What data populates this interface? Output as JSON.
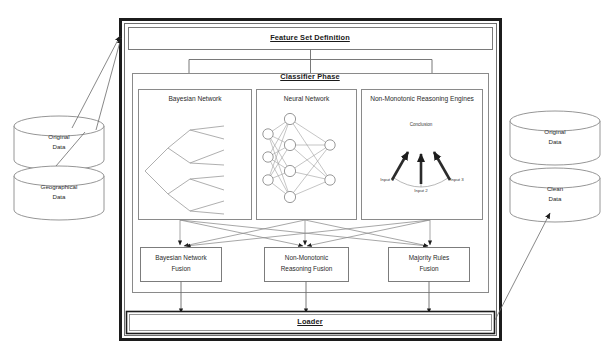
{
  "diagram": {
    "title_top": "Feature Set Definition",
    "title_bottom": "Loader",
    "classifier_phase_label": "Classifier Phase",
    "classifiers": [
      {
        "label": "Bayesian Network"
      },
      {
        "label": "Neural Network"
      },
      {
        "label": "Non-Monotonic Reasoning Engines"
      }
    ],
    "nmr_detail": {
      "conclusion": "Conclusion",
      "input1": "Input 1",
      "input2": "Input 2",
      "input3": "Input 3"
    },
    "fusion": [
      {
        "line1": "Bayesian Network",
        "line2": "Fusion"
      },
      {
        "line1": "Non-Monotonic",
        "line2": "Reasoning Fusion"
      },
      {
        "line1": "Majority Rules",
        "line2": "Fusion"
      }
    ],
    "datastores_left": [
      {
        "line1": "Original",
        "line2": "Data"
      },
      {
        "line1": "Geographical",
        "line2": "Data"
      }
    ],
    "datastores_right": [
      {
        "line1": "Original",
        "line2": "Data"
      },
      {
        "line1": "Clean",
        "line2": "Data"
      }
    ],
    "colors": {
      "stroke": "#404040",
      "thick_stroke": "#1c1c1c",
      "text": "#1a1a1a",
      "background": "#ffffff"
    }
  }
}
